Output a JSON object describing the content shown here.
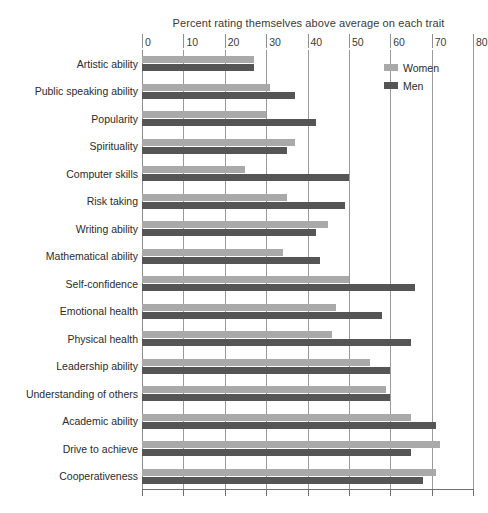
{
  "chart_data": {
    "type": "bar",
    "orientation": "horizontal",
    "title": "Percent rating themselves above average on each trait",
    "xlabel": "",
    "ylabel": "",
    "xlim": [
      0,
      80
    ],
    "xticks": [
      0,
      10,
      20,
      30,
      40,
      50,
      60,
      70,
      80
    ],
    "grid": true,
    "legend_position": "top-right",
    "categories": [
      "Artistic ability",
      "Public speaking ability",
      "Popularity",
      "Spirituality",
      "Computer skills",
      "Risk taking",
      "Writing ability",
      "Mathematical ability",
      "Self-confidence",
      "Emotional health",
      "Physical health",
      "Leadership ability",
      "Understanding of others",
      "Academic ability",
      "Drive to achieve",
      "Cooperativeness"
    ],
    "series": [
      {
        "name": "Women",
        "color": "#a9a9a9",
        "values": [
          27,
          31,
          30,
          37,
          25,
          35,
          45,
          34,
          50,
          47,
          46,
          55,
          59,
          65,
          72,
          71
        ]
      },
      {
        "name": "Men",
        "color": "#555555",
        "values": [
          27,
          37,
          42,
          35,
          50,
          49,
          42,
          43,
          66,
          58,
          65,
          60,
          60,
          71,
          65,
          68
        ]
      }
    ]
  },
  "legend": {
    "items": [
      {
        "label": "Women",
        "color": "#a9a9a9"
      },
      {
        "label": "Men",
        "color": "#555555"
      }
    ]
  }
}
